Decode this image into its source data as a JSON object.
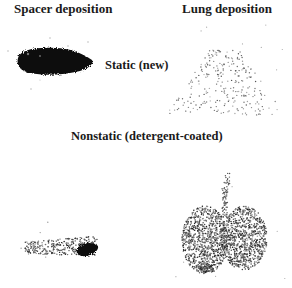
{
  "figure": {
    "column_headers": {
      "spacer": "Spacer deposition",
      "lung": "Lung deposition"
    },
    "row_labels": {
      "static": "Static (new)",
      "nonstatic": "Nonstatic (detergent-coated)"
    },
    "panels": [
      {
        "row": "static",
        "column": "spacer",
        "description": "dense dark elongated deposit"
      },
      {
        "row": "static",
        "column": "lung",
        "description": "sparse scattered lung deposition"
      },
      {
        "row": "nonstatic",
        "column": "spacer",
        "description": "faint elongated deposit, dense at right end"
      },
      {
        "row": "nonstatic",
        "column": "lung",
        "description": "dense bilateral lung deposition with trachea"
      }
    ],
    "colors": {
      "ink": "#111111",
      "background": "#ffffff"
    }
  }
}
